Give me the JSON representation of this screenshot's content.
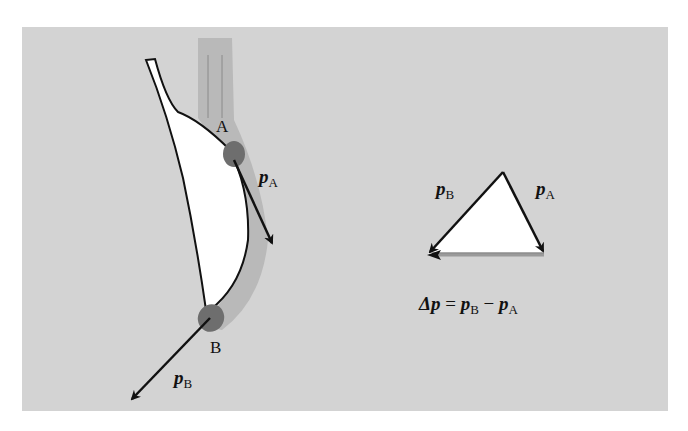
{
  "figure": {
    "background_color": "#d3d3d3",
    "stream_color": "#b0b0b0",
    "blob_color": "#6e6e6e",
    "blade_fill": "#ffffff",
    "arrow_color": "#111111",
    "delta_arrow_color": "#9a9a9a"
  },
  "labels": {
    "point_a": "A",
    "point_b": "B",
    "pa_main": "p",
    "pa_sub": "A",
    "pb_main": "p",
    "pb_sub": "B",
    "tri_pb_main": "p",
    "tri_pb_sub": "B",
    "tri_pa_main": "p",
    "tri_pa_sub": "A"
  },
  "equation": {
    "delta": "Δp",
    "equals": " = ",
    "pb": "p",
    "pb_sub": "B",
    "minus": " − ",
    "pa": "p",
    "pa_sub": "A"
  }
}
